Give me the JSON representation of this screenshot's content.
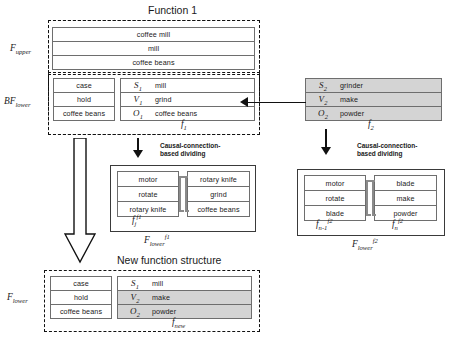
{
  "titles": {
    "function1": "Function 1",
    "new_structure": "New function structure",
    "dividing_left": "Causal-connection-\nbased dividing",
    "dividing_right": "Causal-connection-\nbased dividing"
  },
  "side_labels": {
    "f_upper": "F",
    "f_upper_sub": "upper",
    "bf_lower": "BF",
    "bf_lower_sub": "lower",
    "f_lower": "F",
    "f_lower_sub": "lower"
  },
  "f_upper_block": {
    "rows": [
      "coffee mill",
      "mill",
      "coffee beans"
    ]
  },
  "bf_lower_block": {
    "left_rows": [
      "case",
      "hold",
      "coffee beans"
    ],
    "right_rows": [
      {
        "sym": "S",
        "sub": "1",
        "text": "mill",
        "shaded": false
      },
      {
        "sym": "V",
        "sub": "1",
        "text": "grind",
        "shaded": false
      },
      {
        "sym": "O",
        "sub": "1",
        "text": "coffee beans",
        "shaded": false
      }
    ],
    "label": "f",
    "label_sub": "1"
  },
  "f2_block": {
    "rows": [
      {
        "sym": "S",
        "sub": "2",
        "text": "grinder",
        "shaded": true
      },
      {
        "sym": "V",
        "sub": "2",
        "text": "make",
        "shaded": true
      },
      {
        "sym": "O",
        "sub": "2",
        "text": "powder",
        "shaded": true
      }
    ],
    "label": "f",
    "label_sub": "2"
  },
  "f_lower_f1_block": {
    "left_rows": [
      "motor",
      "rotate",
      "rotary knife"
    ],
    "right_rows": [
      "rotary knife",
      "grind",
      "coffee beans"
    ],
    "left_label": "f",
    "left_label_sub": "j",
    "left_label_sup": "f1",
    "outer_label": "F",
    "outer_label_sub": "lower",
    "outer_label_sup": "f1"
  },
  "f_lower_f2_block": {
    "left_rows": [
      "motor",
      "rotate",
      "blade"
    ],
    "right_rows": [
      "blade",
      "make",
      "powder"
    ],
    "left_label": "f",
    "left_label_sub": "n-1",
    "left_label_sup": "f2",
    "right_label": "f",
    "right_label_sub": "n",
    "right_label_sup": "f2",
    "outer_label": "F",
    "outer_label_sub": "lower",
    "outer_label_sup": "f2"
  },
  "f_new_block": {
    "left_rows": [
      "case",
      "hold",
      "coffee beans"
    ],
    "right_rows": [
      {
        "sym": "S",
        "sub": "1",
        "text": "mill",
        "shaded": false
      },
      {
        "sym": "V",
        "sub": "2",
        "text": "make",
        "shaded": true
      },
      {
        "sym": "O",
        "sub": "2",
        "text": "powder",
        "shaded": true
      }
    ],
    "label": "f",
    "label_sub": "new"
  },
  "colors": {
    "shade": "#d4d4d4",
    "line": "#6e6e6e",
    "ink": "#111111"
  }
}
